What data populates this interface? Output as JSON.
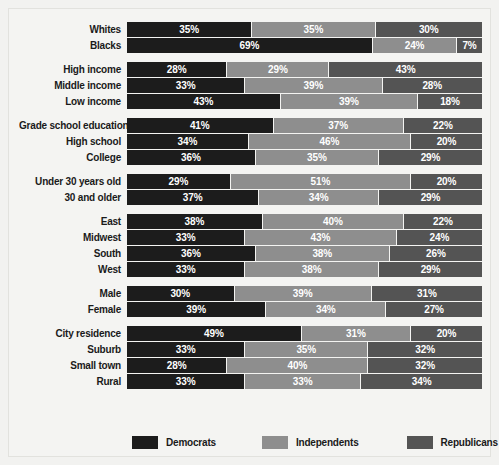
{
  "chart_data": {
    "type": "bar",
    "orientation": "horizontal",
    "stacked": true,
    "title": "",
    "xlabel": "",
    "ylabel": "",
    "xlim": [
      0,
      100
    ],
    "grid": false,
    "legend_position": "bottom",
    "series": [
      {
        "name": "Democrats",
        "color": "#1c1c1c"
      },
      {
        "name": "Independents",
        "color": "#8e8e8e"
      },
      {
        "name": "Republicans",
        "color": "#545454"
      }
    ],
    "groups": [
      {
        "name": "race",
        "rows": [
          {
            "label": "Whites",
            "values": [
              35,
              35,
              30
            ],
            "labels": [
              "35%",
              "35%",
              "30%"
            ]
          },
          {
            "label": "Blacks",
            "values": [
              69,
              24,
              7
            ],
            "labels": [
              "69%",
              "24%",
              "7%"
            ]
          }
        ]
      },
      {
        "name": "income",
        "rows": [
          {
            "label": "High income",
            "values": [
              28,
              29,
              43
            ],
            "labels": [
              "28%",
              "29%",
              "43%"
            ]
          },
          {
            "label": "Middle income",
            "values": [
              33,
              39,
              28
            ],
            "labels": [
              "33%",
              "39%",
              "28%"
            ]
          },
          {
            "label": "Low income",
            "values": [
              43,
              39,
              18
            ],
            "labels": [
              "43%",
              "39%",
              "18%"
            ]
          }
        ]
      },
      {
        "name": "education",
        "rows": [
          {
            "label": "Grade school education",
            "values": [
              41,
              37,
              22
            ],
            "labels": [
              "41%",
              "37%",
              "22%"
            ]
          },
          {
            "label": "High school",
            "values": [
              34,
              46,
              20
            ],
            "labels": [
              "34%",
              "46%",
              "20%"
            ]
          },
          {
            "label": "College",
            "values": [
              36,
              35,
              29
            ],
            "labels": [
              "36%",
              "35%",
              "29%"
            ]
          }
        ]
      },
      {
        "name": "age",
        "rows": [
          {
            "label": "Under 30 years old",
            "values": [
              29,
              51,
              20
            ],
            "labels": [
              "29%",
              "51%",
              "20%"
            ]
          },
          {
            "label": "30 and older",
            "values": [
              37,
              34,
              29
            ],
            "labels": [
              "37%",
              "34%",
              "29%"
            ]
          }
        ]
      },
      {
        "name": "region",
        "rows": [
          {
            "label": "East",
            "values": [
              38,
              40,
              22
            ],
            "labels": [
              "38%",
              "40%",
              "22%"
            ]
          },
          {
            "label": "Midwest",
            "values": [
              33,
              43,
              24
            ],
            "labels": [
              "33%",
              "43%",
              "24%"
            ]
          },
          {
            "label": "South",
            "values": [
              36,
              38,
              26
            ],
            "labels": [
              "36%",
              "38%",
              "26%"
            ]
          },
          {
            "label": "West",
            "values": [
              33,
              38,
              29
            ],
            "labels": [
              "33%",
              "38%",
              "29%"
            ]
          }
        ]
      },
      {
        "name": "gender",
        "rows": [
          {
            "label": "Male",
            "values": [
              30,
              39,
              31
            ],
            "labels": [
              "30%",
              "39%",
              "31%"
            ]
          },
          {
            "label": "Female",
            "values": [
              39,
              34,
              27
            ],
            "labels": [
              "39%",
              "34%",
              "27%"
            ]
          }
        ]
      },
      {
        "name": "residence",
        "rows": [
          {
            "label": "City residence",
            "values": [
              49,
              31,
              20
            ],
            "labels": [
              "49%",
              "31%",
              "20%"
            ]
          },
          {
            "label": "Suburb",
            "values": [
              33,
              35,
              32
            ],
            "labels": [
              "33%",
              "35%",
              "32%"
            ]
          },
          {
            "label": "Small town",
            "values": [
              28,
              40,
              32
            ],
            "labels": [
              "28%",
              "40%",
              "32%"
            ]
          },
          {
            "label": "Rural",
            "values": [
              33,
              33,
              34
            ],
            "labels": [
              "33%",
              "33%",
              "34%"
            ]
          }
        ]
      }
    ]
  },
  "legend": {
    "items": [
      {
        "label": "Democrats",
        "color": "#1c1c1c"
      },
      {
        "label": "Independents",
        "color": "#8e8e8e"
      },
      {
        "label": "Republicans",
        "color": "#545454"
      }
    ]
  }
}
